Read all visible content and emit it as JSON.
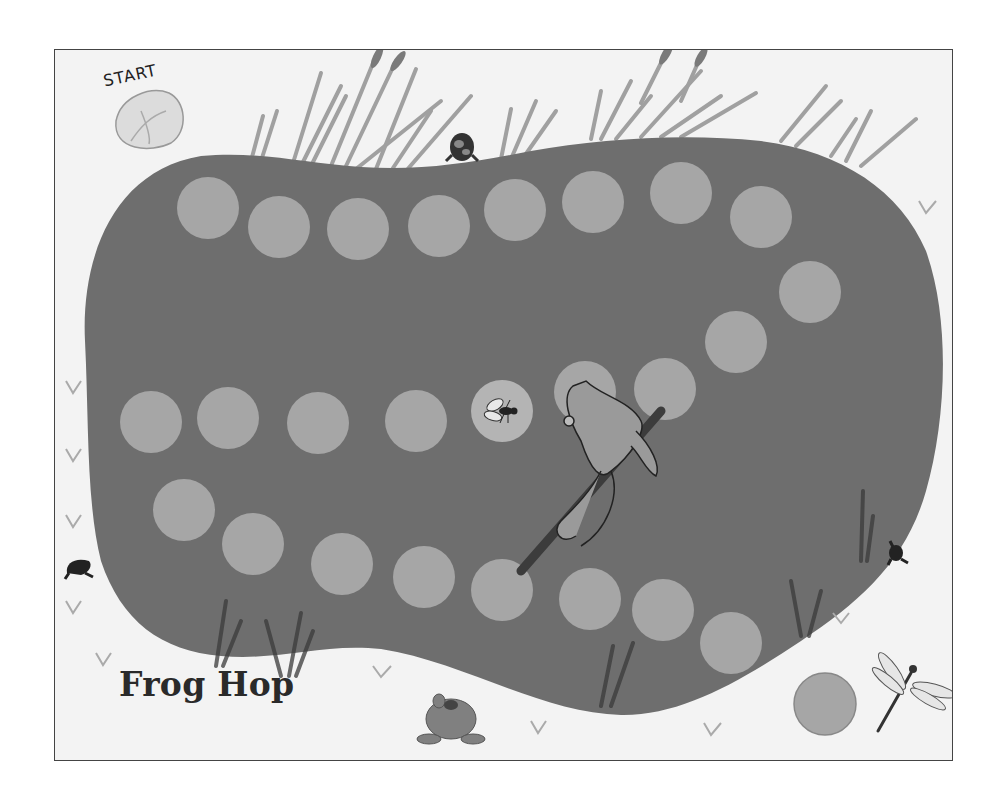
{
  "game": {
    "title": "Frog Hop",
    "start_label": "START"
  },
  "colors": {
    "page_bg": "#ffffff",
    "board_bg": "#f3f3f3",
    "pond": "#6e6e6e",
    "space": "#a6a6a6",
    "border": "#444444",
    "grass": "#8a8a8a"
  },
  "board": {
    "spaces": [
      {
        "id": 1,
        "x": 207,
        "y": 207
      },
      {
        "id": 2,
        "x": 278,
        "y": 226
      },
      {
        "id": 3,
        "x": 357,
        "y": 228
      },
      {
        "id": 4,
        "x": 438,
        "y": 225
      },
      {
        "id": 5,
        "x": 514,
        "y": 209
      },
      {
        "id": 6,
        "x": 592,
        "y": 201
      },
      {
        "id": 7,
        "x": 680,
        "y": 192
      },
      {
        "id": 8,
        "x": 760,
        "y": 216
      },
      {
        "id": 9,
        "x": 809,
        "y": 291
      },
      {
        "id": 10,
        "x": 735,
        "y": 341
      },
      {
        "id": 11,
        "x": 664,
        "y": 388
      },
      {
        "id": 12,
        "x": 584,
        "y": 391,
        "note": "frog-on-stick"
      },
      {
        "id": 13,
        "x": 501,
        "y": 410,
        "icon": "fly"
      },
      {
        "id": 14,
        "x": 415,
        "y": 420
      },
      {
        "id": 15,
        "x": 317,
        "y": 422
      },
      {
        "id": 16,
        "x": 227,
        "y": 417
      },
      {
        "id": 17,
        "x": 150,
        "y": 421
      },
      {
        "id": 18,
        "x": 183,
        "y": 509
      },
      {
        "id": 19,
        "x": 252,
        "y": 543
      },
      {
        "id": 20,
        "x": 341,
        "y": 563
      },
      {
        "id": 21,
        "x": 423,
        "y": 576
      },
      {
        "id": 22,
        "x": 501,
        "y": 589
      },
      {
        "id": 23,
        "x": 589,
        "y": 598
      },
      {
        "id": 24,
        "x": 662,
        "y": 609
      },
      {
        "id": 25,
        "x": 730,
        "y": 642
      }
    ],
    "space_radius": 31,
    "finish_space": {
      "x": 824,
      "y": 703,
      "r": 31
    },
    "start_pad": {
      "x": 148,
      "y": 116
    }
  },
  "decorations": [
    {
      "name": "frog-top",
      "x": 460,
      "y": 146
    },
    {
      "name": "frog-left",
      "x": 78,
      "y": 565
    },
    {
      "name": "frog-right",
      "x": 895,
      "y": 552
    },
    {
      "name": "frog-bottom",
      "x": 450,
      "y": 715
    },
    {
      "name": "dragonfly",
      "x": 910,
      "y": 690
    },
    {
      "name": "frog-on-stick",
      "x": 590,
      "y": 450
    }
  ]
}
